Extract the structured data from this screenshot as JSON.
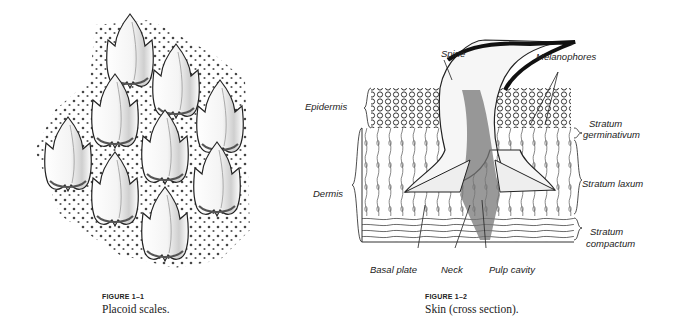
{
  "figures": [
    {
      "number": "FIGURE 1–1",
      "caption": "Placoid scales.",
      "illustration": "placoid-scales-drawing"
    },
    {
      "number": "FIGURE 1–2",
      "caption": "Skin (cross section).",
      "illustration": "skin-cross-section-drawing",
      "labels": {
        "spine": "Spine",
        "melanophores": "Melanophores",
        "epidermis": "Epidermis",
        "stratum_germinativum_1": "Stratum",
        "stratum_germinativum_2": "germinativum",
        "dermis": "Dermis",
        "stratum_laxum": "Stratum laxum",
        "stratum_compactum_1": "Stratum",
        "stratum_compactum_2": "compactum",
        "basal_plate": "Basal plate",
        "neck": "Neck",
        "pulp_cavity": "Pulp cavity"
      }
    }
  ]
}
